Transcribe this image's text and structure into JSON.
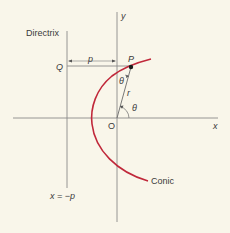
{
  "diagram": {
    "labels": {
      "directrix": "Directrix",
      "q": "Q",
      "p_distance": "p",
      "point_p": "P",
      "y_axis": "y",
      "x_axis": "x",
      "origin": "O",
      "r": "r",
      "theta_at_p": "θ",
      "theta_at_origin": "θ",
      "conic": "Conic",
      "directrix_equation": "x = −p"
    },
    "colors": {
      "background": "#f9f6ea",
      "axis": "#8a8a8a",
      "curve": "#c0283a",
      "text": "#3a3a3a",
      "point": "#1a1a1a"
    }
  }
}
